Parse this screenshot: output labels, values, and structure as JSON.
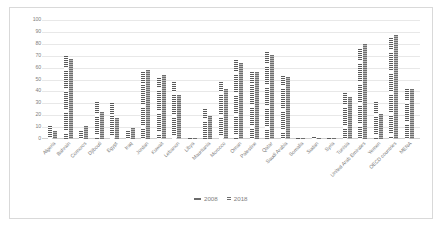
{
  "chart_data": {
    "type": "bar",
    "title": "",
    "xlabel": "",
    "ylabel": "",
    "ylim": [
      0,
      100
    ],
    "ytick_values": [
      0,
      10,
      20,
      30,
      40,
      50,
      60,
      70,
      80,
      90,
      100
    ],
    "grid": true,
    "legend_position": "bottom-center",
    "categories": [
      "Algeria",
      "Bahrain",
      "Comoros",
      "Djibouti",
      "Egypt",
      "Iraq",
      "Jordan",
      "Kuwait",
      "Lebanon",
      "Libya",
      "Mauritania",
      "Morocco",
      "Oman",
      "Palestine",
      "Qatar",
      "Saudi Arabia",
      "Somalia",
      "Sudan",
      "Syria",
      "Tunisia",
      "United Arab Emirates",
      "Yemen",
      "OECD countries",
      "MENA"
    ],
    "series": [
      {
        "name": "2008",
        "marker": "dash",
        "color": "#6b6b6b",
        "values": [
          11,
          70,
          7,
          31,
          30,
          7,
          56,
          51,
          48,
          1,
          25,
          48,
          66,
          56,
          73,
          53,
          1,
          2,
          1,
          39,
          76,
          31,
          85,
          42
        ]
      },
      {
        "name": "2018",
        "marker": "dots",
        "color": "#8d8d8d",
        "values": [
          7,
          67,
          11,
          23,
          18,
          9,
          58,
          54,
          37,
          1,
          19,
          42,
          64,
          56,
          71,
          52,
          0,
          1,
          1,
          35,
          80,
          21,
          87,
          42
        ]
      }
    ]
  }
}
